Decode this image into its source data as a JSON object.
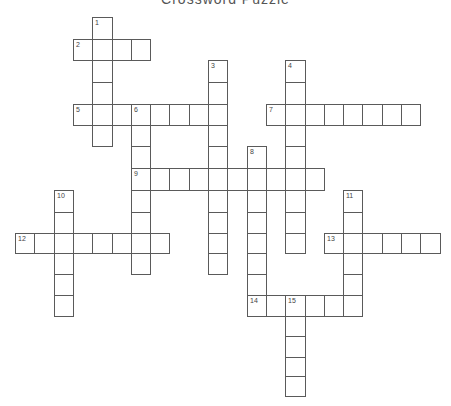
{
  "title": "Crossword Puzzle",
  "grid": {
    "origin_x": 15,
    "cell_width": 19.3,
    "row_tops": [
      16.7,
      38.5,
      60,
      82,
      103.5,
      125,
      146,
      168,
      190,
      211.5,
      232.5,
      253,
      273.5,
      294.5,
      315.5,
      336,
      356.5,
      376,
      396
    ]
  },
  "words": [
    {
      "number": 1,
      "direction": "down",
      "row": 0,
      "col": 4,
      "length": 6
    },
    {
      "number": 2,
      "direction": "across",
      "row": 1,
      "col": 3,
      "length": 4
    },
    {
      "number": 3,
      "direction": "down",
      "row": 2,
      "col": 10,
      "length": 10
    },
    {
      "number": 4,
      "direction": "down",
      "row": 2,
      "col": 14,
      "length": 9
    },
    {
      "number": 5,
      "direction": "across",
      "row": 4,
      "col": 3,
      "length": 8
    },
    {
      "number": 6,
      "direction": "down",
      "row": 4,
      "col": 6,
      "length": 8
    },
    {
      "number": 7,
      "direction": "across",
      "row": 4,
      "col": 13,
      "length": 8
    },
    {
      "number": 8,
      "direction": "down",
      "row": 6,
      "col": 12,
      "length": 8
    },
    {
      "number": 9,
      "direction": "across",
      "row": 7,
      "col": 6,
      "length": 10
    },
    {
      "number": 10,
      "direction": "down",
      "row": 8,
      "col": 2,
      "length": 6
    },
    {
      "number": 11,
      "direction": "down",
      "row": 8,
      "col": 17,
      "length": 6
    },
    {
      "number": 12,
      "direction": "across",
      "row": 10,
      "col": 0,
      "length": 8
    },
    {
      "number": 13,
      "direction": "across",
      "row": 10,
      "col": 16,
      "length": 6
    },
    {
      "number": 14,
      "direction": "across",
      "row": 13,
      "col": 12,
      "length": 6
    },
    {
      "number": 15,
      "direction": "down",
      "row": 13,
      "col": 14,
      "length": 5
    }
  ]
}
